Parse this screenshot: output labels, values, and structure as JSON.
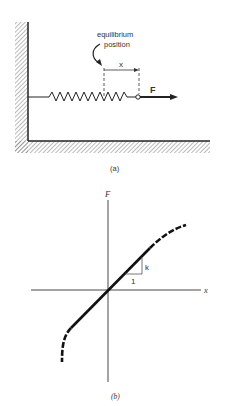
{
  "figure_a": {
    "caption": "(a)",
    "annotation_line1": "equilibrium",
    "annotation_line2": "position",
    "displacement_label": "x",
    "force_label": "F"
  },
  "figure_b": {
    "caption": "(b)",
    "y_axis_label": "F",
    "x_axis_label": "x",
    "slope_label": "k",
    "run_label": "1"
  },
  "colors": {
    "ink": "#222222",
    "hatch": "#888888"
  }
}
